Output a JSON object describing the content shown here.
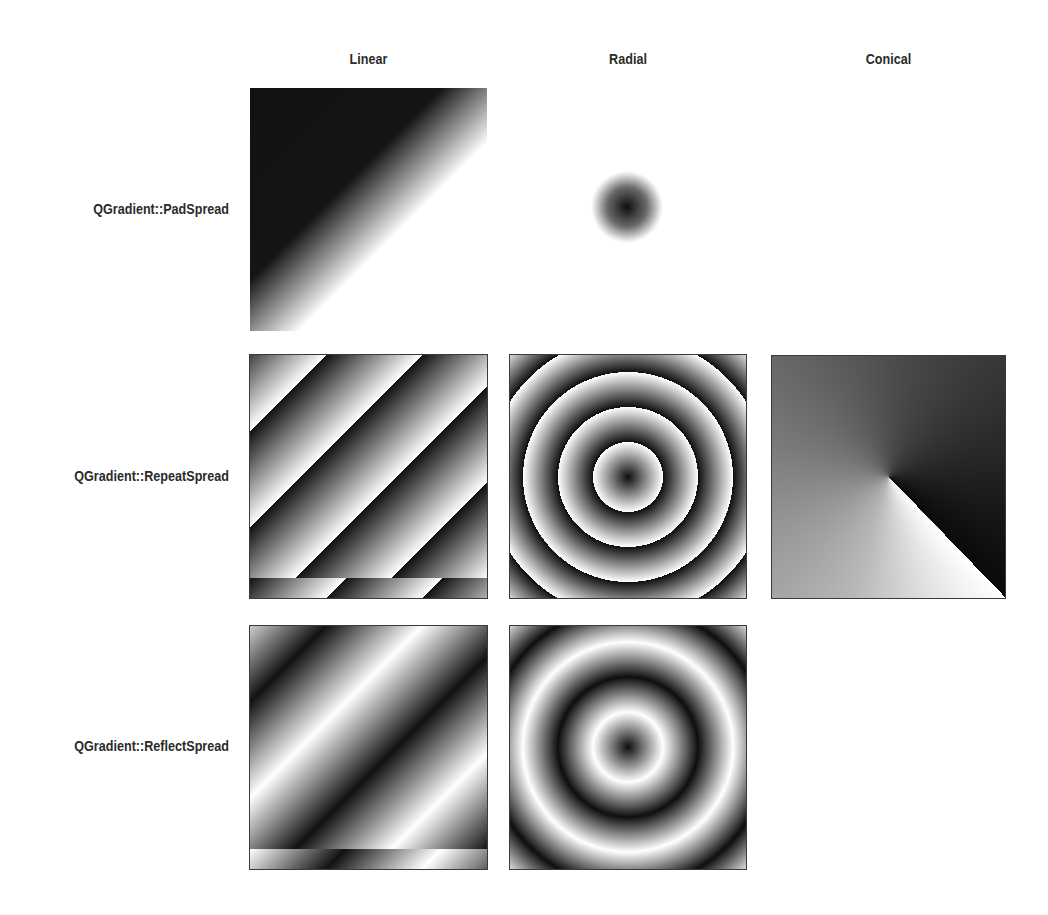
{
  "columns": [
    {
      "label": "Linear"
    },
    {
      "label": "Radial"
    },
    {
      "label": "Conical"
    }
  ],
  "rows": [
    {
      "label": "QGradient::PadSpread"
    },
    {
      "label": "QGradient::RepeatSpread"
    },
    {
      "label": "QGradient::ReflectSpread"
    }
  ],
  "grid": [
    {
      "row": "QGradient::PadSpread",
      "cells": [
        {
          "type": "linear",
          "spread": "pad",
          "rendered": true
        },
        {
          "type": "radial",
          "spread": "pad",
          "rendered": true
        },
        {
          "type": "conical",
          "spread": "pad",
          "rendered": false
        }
      ]
    },
    {
      "row": "QGradient::RepeatSpread",
      "cells": [
        {
          "type": "linear",
          "spread": "repeat",
          "rendered": true
        },
        {
          "type": "radial",
          "spread": "repeat",
          "rendered": true
        },
        {
          "type": "conical",
          "spread": "repeat",
          "rendered": true
        }
      ]
    },
    {
      "row": "QGradient::ReflectSpread",
      "cells": [
        {
          "type": "linear",
          "spread": "reflect",
          "rendered": true
        },
        {
          "type": "radial",
          "spread": "reflect",
          "rendered": true
        },
        {
          "type": "conical",
          "spread": "reflect",
          "rendered": false
        }
      ]
    }
  ],
  "colors": {
    "gradient_start": "#111111",
    "gradient_end": "#ffffff",
    "text": "#2b2b2b",
    "background": "#ffffff"
  }
}
